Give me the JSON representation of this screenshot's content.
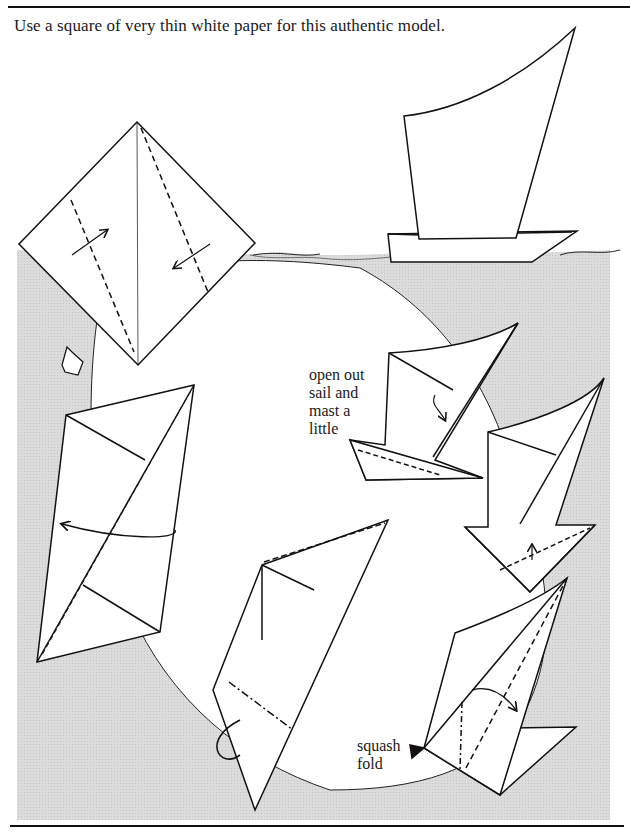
{
  "page": {
    "intro_text": "Use a square of very thin white paper for this authentic model.",
    "background_color": "#ffffff",
    "water_color": "#d9d9d9",
    "line_color": "#111111"
  },
  "diagrams": [
    {
      "id": "step-1",
      "description": "square diamond with valley folds and arrows"
    },
    {
      "id": "finished-model",
      "description": "completed sailboat on water"
    },
    {
      "id": "step-2",
      "description": "folded kite with turn-over arrow"
    },
    {
      "id": "step-3",
      "description": "fold with mountain fold and pleat"
    },
    {
      "id": "step-4",
      "description": "squash fold step"
    },
    {
      "id": "step-5",
      "description": "boat base fold"
    },
    {
      "id": "step-6",
      "description": "open out sail and mast step"
    }
  ],
  "labels": {
    "open_out": [
      "open out",
      "sail and",
      "mast a",
      "little"
    ],
    "squash": [
      "squash",
      "fold"
    ]
  }
}
